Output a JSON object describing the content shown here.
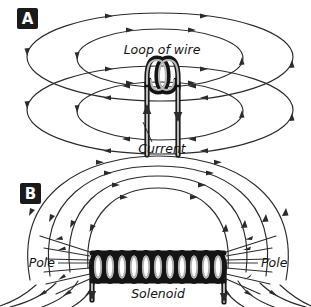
{
  "figure": {
    "background_color": "#ffffff",
    "stroke_color": "#2b2b2b",
    "wire_color": "#141414",
    "badge_color": "#1a1a1a",
    "badge_text_color": "#ffffff",
    "width": 311,
    "height": 307
  },
  "panels": [
    {
      "id": "A",
      "badge_label": "A",
      "subject": "loop-of-wire",
      "labels": {
        "loop": "Loop of wire",
        "current": "Current"
      },
      "field_lines": {
        "type": "concentric-ellipses",
        "above_count": 2,
        "below_count": 2,
        "direction": "clockwise-from-front"
      },
      "wire": {
        "turns": 2,
        "lead_count": 2,
        "left_lead_arrow": "up",
        "right_lead_arrow": "down"
      }
    },
    {
      "id": "B",
      "badge_label": "B",
      "subject": "solenoid",
      "labels": {
        "pole_left": "Pole",
        "pole_right": "Pole",
        "solenoid": "Solenoid"
      },
      "field_lines": {
        "type": "nested-arcs",
        "above_count": 4,
        "below_count": 4,
        "direction": "left-to-right-over-top"
      },
      "coil": {
        "turns": 11,
        "lead_count": 2
      }
    }
  ]
}
